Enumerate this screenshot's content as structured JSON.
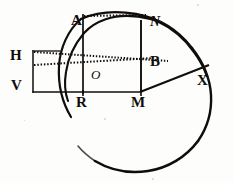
{
  "figure": {
    "kind": "geometric-diagram",
    "background_color": "#fdfdfb",
    "ink_color": "#100d0a",
    "width": 234,
    "height": 183
  },
  "labels": [
    {
      "id": "A",
      "text": "A",
      "x": 71,
      "y": 13,
      "style": "roman"
    },
    {
      "id": "N",
      "text": "N",
      "x": 150,
      "y": 15,
      "style": "italic"
    },
    {
      "id": "H",
      "text": "H",
      "x": 10,
      "y": 48,
      "style": "roman"
    },
    {
      "id": "B",
      "text": "B",
      "x": 150,
      "y": 54,
      "style": "roman"
    },
    {
      "id": "O",
      "text": "O",
      "x": 91,
      "y": 68,
      "style": "italic-small"
    },
    {
      "id": "V",
      "text": "V",
      "x": 11,
      "y": 78,
      "style": "roman"
    },
    {
      "id": "X",
      "text": "X",
      "x": 197,
      "y": 73,
      "style": "roman"
    },
    {
      "id": "R",
      "text": "R",
      "x": 76,
      "y": 95,
      "style": "roman"
    },
    {
      "id": "M",
      "text": "M",
      "x": 131,
      "y": 95,
      "style": "roman"
    }
  ],
  "geometry": {
    "circle": {
      "cx": 137,
      "cy": 92,
      "r": 79
    },
    "rect": {
      "left": 33,
      "top": 51,
      "right": 141,
      "bottom": 92
    },
    "vertical_AR": {
      "x": 83,
      "top": 14,
      "bottom": 95
    },
    "vertical_NM": {
      "x": 141,
      "top": 22,
      "bottom": 92
    },
    "baseline_VM": {
      "y": 92,
      "left": 33,
      "right": 141
    },
    "chord_MX": {
      "x1": 141,
      "y1": 92,
      "x2": 208,
      "y2": 66
    },
    "arc_ANX": {
      "from": "A",
      "over": "N",
      "to": "X"
    },
    "dotted_top": {
      "y": 16,
      "left": 84,
      "right": 144
    },
    "dotted_upper": {
      "x1": 34,
      "y1": 52,
      "x2": 166,
      "y2": 60
    },
    "dotted_lower": {
      "x1": 34,
      "y1": 64,
      "x2": 152,
      "y2": 58
    }
  }
}
